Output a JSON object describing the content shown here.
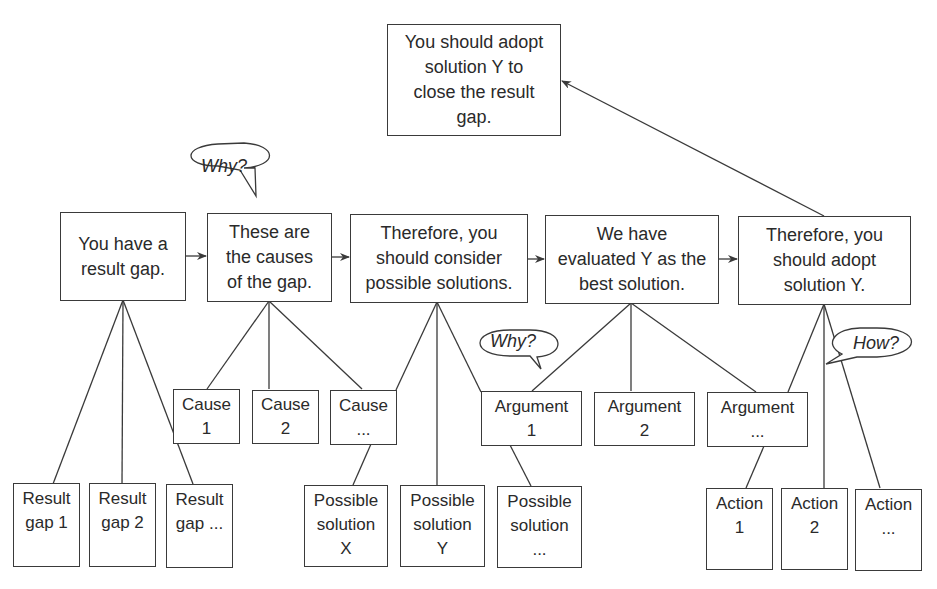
{
  "diagram": {
    "conclusion": "You should adopt\nsolution Y to\nclose the result\ngap.",
    "main_chain": [
      "You have a\nresult gap.",
      "These are\nthe causes\nof the gap.",
      "Therefore, you\nshould consider\npossible solutions.",
      "We have\nevaluated Y as the\nbest solution.",
      "Therefore, you\nshould adopt\nsolution Y."
    ],
    "causes": [
      "Cause\n1",
      "Cause\n2",
      "Cause\n..."
    ],
    "arguments": [
      "Argument\n1",
      "Argument\n2",
      "Argument\n..."
    ],
    "result_gaps": [
      "Result\ngap 1",
      "Result\ngap 2",
      "Result\ngap ..."
    ],
    "possible_solutions": [
      "Possible\nsolution\nX",
      "Possible\nsolution\nY",
      "Possible\nsolution\n..."
    ],
    "actions": [
      "Action\n1",
      "Action\n2",
      "Action\n..."
    ],
    "bubbles": {
      "why_causes": "Why?",
      "why_arguments": "Why?",
      "how_actions": "How?"
    },
    "colors": {
      "line": "#3a3a3a",
      "background": "#ffffff",
      "text": "#2a2a2a"
    }
  }
}
